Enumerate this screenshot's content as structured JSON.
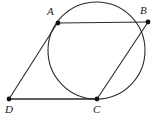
{
  "figure": {
    "type": "geometry-diagram",
    "width": 153,
    "height": 123,
    "background_color": "#ffffff",
    "stroke_color": "#2b2b2b",
    "point_color": "#111111",
    "stroke_width": 1.1,
    "point_radius": 2.4,
    "circle": {
      "name": "main-circle",
      "cx": 96.5,
      "cy": 50.5,
      "r": 48.5
    },
    "points": [
      {
        "id": "A",
        "label": "A",
        "x": 58,
        "y": 23,
        "on_circle": true
      },
      {
        "id": "B",
        "label": "B",
        "x": 148,
        "y": 22,
        "on_circle": false
      },
      {
        "id": "C",
        "label": "C",
        "x": 97,
        "y": 99,
        "on_circle": true
      },
      {
        "id": "D",
        "label": "D",
        "x": 9,
        "y": 99,
        "on_circle": false
      }
    ],
    "segments": [
      {
        "id": "AB",
        "name": "segment-a-b",
        "x1": 58,
        "y1": 23,
        "x2": 148,
        "y2": 22
      },
      {
        "id": "DA",
        "name": "segment-d-a",
        "x1": 9,
        "y1": 99,
        "x2": 58,
        "y2": 22
      },
      {
        "id": "DC",
        "name": "segment-d-c",
        "x1": 9,
        "y1": 99,
        "x2": 97,
        "y2": 99
      },
      {
        "id": "CB",
        "name": "segment-c-b",
        "x1": 97,
        "y1": 99,
        "x2": 148,
        "y2": 22
      }
    ],
    "labels": {
      "A": "A",
      "B": "B",
      "C": "C",
      "D": "D"
    }
  }
}
